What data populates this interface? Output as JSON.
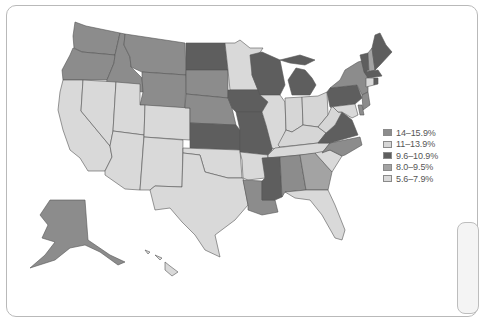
{
  "map": {
    "type": "choropleth",
    "region": "United States",
    "stroke_color": "#555555",
    "bins": [
      {
        "id": "b1",
        "label": "14–15.9%",
        "color": "#8c8c8c"
      },
      {
        "id": "b2",
        "label": "11–13.9%",
        "color": "#d6d6d6"
      },
      {
        "id": "b3",
        "label": "9.6–10.9%",
        "color": "#5e5e5e"
      },
      {
        "id": "b4",
        "label": "8.0–9.5%",
        "color": "#a3a3a3"
      },
      {
        "id": "b5",
        "label": "5.6–7.9%",
        "color": "#d9d9d9"
      }
    ],
    "states": {
      "WA": "b1",
      "OR": "b1",
      "ID": "b1",
      "MT": "b1",
      "WY": "b1",
      "ND": "b3",
      "SD": "b1",
      "NE": "b1",
      "KS": "b3",
      "OK": "b5",
      "TX": "b5",
      "CA": "b5",
      "NV": "b5",
      "UT": "b5",
      "AZ": "b5",
      "CO": "b5",
      "NM": "b5",
      "MN": "b5",
      "IA": "b3",
      "MO": "b3",
      "AR": "b5",
      "LA": "b1",
      "WI": "b3",
      "IL": "b5",
      "MI": "b3",
      "IN": "b2",
      "OH": "b2",
      "KY": "b2",
      "TN": "b5",
      "MS": "b3",
      "AL": "b1",
      "GA": "b4",
      "FL": "b5",
      "SC": "b5",
      "NC": "b1",
      "VA": "b3",
      "WV": "b2",
      "PA": "b3",
      "NY": "b1",
      "VT": "b3",
      "NH": "b4",
      "ME": "b3",
      "MA": "b3",
      "RI": "b3",
      "CT": "b5",
      "NJ": "b1",
      "DE": "b1",
      "MD": "b5",
      "AK": "b1",
      "HI": "b5"
    }
  },
  "legend": {
    "items": [
      {
        "label": "14–15.9%",
        "color": "#8c8c8c"
      },
      {
        "label": "11–13.9%",
        "color": "#d6d6d6"
      },
      {
        "label": "9.6–10.9%",
        "color": "#5e5e5e"
      },
      {
        "label": "8.0–9.5%",
        "color": "#a3a3a3"
      },
      {
        "label": "5.6–7.9%",
        "color": "#d9d9d9"
      }
    ]
  }
}
